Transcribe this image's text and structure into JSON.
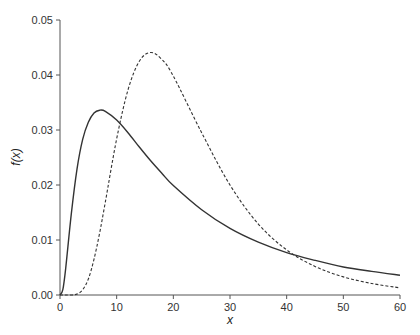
{
  "chart_data": {
    "type": "line",
    "title": "",
    "xlabel": "x",
    "ylabel": "f(x)",
    "xlim": [
      0,
      60
    ],
    "ylim": [
      0,
      0.05
    ],
    "grid": false,
    "legend": null,
    "x_ticks": [
      0,
      10,
      20,
      30,
      40,
      50,
      60
    ],
    "x_tick_labels": [
      "0",
      "10",
      "20",
      "30",
      "40",
      "50",
      "60"
    ],
    "y_ticks": [
      0,
      0.01,
      0.02,
      0.03,
      0.04,
      0.05
    ],
    "y_tick_labels": [
      "0.00",
      "0.01",
      "0.02",
      "0.03",
      "0.04",
      "0.05"
    ],
    "x": [
      0,
      0.5,
      1,
      2,
      3,
      4,
      5,
      6,
      7,
      8,
      10,
      12,
      14,
      16,
      18,
      20,
      25,
      30,
      35,
      40,
      45,
      50,
      55,
      60
    ],
    "series": [
      {
        "name": "solid curve",
        "style": "solid",
        "color": "#333333",
        "values": [
          0,
          0.00096,
          0.0048,
          0.0148,
          0.0229,
          0.0283,
          0.0314,
          0.0331,
          0.0336,
          0.0334,
          0.0318,
          0.0295,
          0.0269,
          0.0244,
          0.0221,
          0.0199,
          0.0155,
          0.0121,
          0.0096,
          0.0077,
          0.0063,
          0.0051,
          0.0043,
          0.0036
        ]
      },
      {
        "name": "dashed curve",
        "style": "dashed",
        "color": "#333333",
        "values": [
          0,
          0,
          0,
          0,
          0.00016,
          0.00095,
          0.0029,
          0.0065,
          0.0113,
          0.0169,
          0.0284,
          0.0373,
          0.0425,
          0.0441,
          0.0428,
          0.0398,
          0.0295,
          0.02,
          0.0129,
          0.0082,
          0.0052,
          0.0033,
          0.0021,
          0.0013
        ]
      }
    ]
  }
}
